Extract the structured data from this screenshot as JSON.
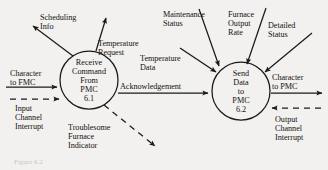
{
  "figure": {
    "type": "data-flow-diagram",
    "background_color": "#f2f1ef",
    "stroke_color": "#1a1a1a",
    "caption": "Figure 6.2"
  },
  "processes": [
    {
      "id": "p61",
      "name": "Receive Command From PMC",
      "number": "6.1",
      "lines": [
        "Receive",
        "Command",
        "From",
        "PMC",
        "6.1"
      ],
      "cx": 89,
      "cy": 80,
      "r": 29
    },
    {
      "id": "p62",
      "name": "Send Data to PMC",
      "number": "6.2",
      "lines": [
        "Send",
        "Data",
        "to",
        "PMC",
        "6.2"
      ],
      "cx": 241,
      "cy": 91,
      "r": 29
    }
  ],
  "flows": [
    {
      "id": "scheduling-info",
      "label": "Scheduling\nInfo",
      "style": "solid",
      "direction": "out",
      "process": "6.1"
    },
    {
      "id": "temperature-request",
      "label": "Temperature\nRequest",
      "style": "solid",
      "direction": "out",
      "process": "6.1"
    },
    {
      "id": "character-to-fmc",
      "label": "Character\nto FMC",
      "style": "solid",
      "direction": "in",
      "process": "6.1"
    },
    {
      "id": "input-channel-interrupt",
      "label": "Input\nChannel\nInterrupt",
      "style": "dashed",
      "direction": "in",
      "process": "6.1"
    },
    {
      "id": "troublesome-furnace-indicator",
      "label": "Troublesome\nFurnace\nIndicator",
      "style": "dashed",
      "direction": "out",
      "process": "6.1"
    },
    {
      "id": "acknowledgement",
      "label": "Acknowledgement",
      "style": "solid",
      "direction": "6.1-to-6.2"
    },
    {
      "id": "temperature-data",
      "label": "Temperature\nData",
      "style": "solid",
      "direction": "in",
      "process": "6.2"
    },
    {
      "id": "maintenance-status",
      "label": "Maintenance\nStatus",
      "style": "solid",
      "direction": "in",
      "process": "6.2"
    },
    {
      "id": "furnace-output-rate",
      "label": "Furnace\nOutput\nRate",
      "style": "solid",
      "direction": "in",
      "process": "6.2"
    },
    {
      "id": "detailed-status",
      "label": "Detailed\nStatus",
      "style": "solid",
      "direction": "in",
      "process": "6.2"
    },
    {
      "id": "character-to-pmc",
      "label": "Character\nto PMC",
      "style": "solid",
      "direction": "out",
      "process": "6.2"
    },
    {
      "id": "output-channel-interrupt",
      "label": "Output\nChannel\nInterrupt",
      "style": "dashed",
      "direction": "in",
      "process": "6.2"
    }
  ],
  "labels": {
    "scheduling_info_l1": "Scheduling",
    "scheduling_info_l2": "Info",
    "temperature_request_l1": "Temperature",
    "temperature_request_l2": "Request",
    "character_to_fmc_l1": "Character",
    "character_to_fmc_l2": "to FMC",
    "input_channel_interrupt_l1": "Input",
    "input_channel_interrupt_l2": "Channel",
    "input_channel_interrupt_l3": "Interrupt",
    "troublesome_l1": "Troublesome",
    "troublesome_l2": "Furnace",
    "troublesome_l3": "Indicator",
    "acknowledgement": "Acknowledgement",
    "temperature_data_l1": "Temperature",
    "temperature_data_l2": "Data",
    "maintenance_status_l1": "Maintenance",
    "maintenance_status_l2": "Status",
    "furnace_output_rate_l1": "Furnace",
    "furnace_output_rate_l2": "Output",
    "furnace_output_rate_l3": "Rate",
    "detailed_status_l1": "Detailed",
    "detailed_status_l2": "Status",
    "character_to_pmc_l1": "Character",
    "character_to_pmc_l2": "to PMC",
    "output_channel_interrupt_l1": "Output",
    "output_channel_interrupt_l2": "Channel",
    "output_channel_interrupt_l3": "Interrupt",
    "p61_l1": "Receive",
    "p61_l2": "Command",
    "p61_l3": "From",
    "p61_l4": "PMC",
    "p61_l5": "6.1",
    "p62_l1": "Send",
    "p62_l2": "Data",
    "p62_l3": "to",
    "p62_l4": "PMC",
    "p62_l5": "6.2",
    "caption": "Figure 6.2"
  }
}
